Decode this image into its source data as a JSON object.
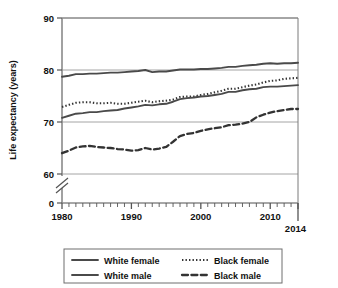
{
  "chart_data": {
    "type": "line",
    "title": "",
    "xlabel": "",
    "ylabel": "Life expectancy (years)",
    "xlim": [
      1980,
      2014
    ],
    "ylim": [
      60,
      90
    ],
    "y_axis_break": true,
    "y_axis_break_note": "axis broken between 0 and 60",
    "grid": true,
    "grid_axis": "y",
    "legend_position": "bottom",
    "y_ticks": [
      0,
      60,
      70,
      80,
      90
    ],
    "y_tick_labels": [
      "0",
      "60",
      "70",
      "80",
      "90"
    ],
    "x_ticks": [
      1980,
      1990,
      2000,
      2010,
      2014
    ],
    "x_tick_labels": [
      "1980",
      "1990",
      "2000",
      "2010",
      "2014"
    ],
    "x_minor_tick_interval": 1,
    "x": [
      1980,
      1981,
      1982,
      1983,
      1984,
      1985,
      1986,
      1987,
      1988,
      1989,
      1990,
      1991,
      1992,
      1993,
      1994,
      1995,
      1996,
      1997,
      1998,
      1999,
      2000,
      2001,
      2002,
      2003,
      2004,
      2005,
      2006,
      2007,
      2008,
      2009,
      2010,
      2011,
      2012,
      2013,
      2014
    ],
    "series": [
      {
        "name": "White female",
        "style": "solid",
        "color": "#4a4a4a",
        "values": [
          78.7,
          78.9,
          79.2,
          79.2,
          79.3,
          79.3,
          79.4,
          79.5,
          79.5,
          79.6,
          79.7,
          79.8,
          80.0,
          79.6,
          79.7,
          79.7,
          79.9,
          80.1,
          80.1,
          80.1,
          80.2,
          80.2,
          80.3,
          80.4,
          80.6,
          80.6,
          80.8,
          80.9,
          81.0,
          81.2,
          81.3,
          81.2,
          81.3,
          81.3,
          81.4
        ]
      },
      {
        "name": "Black female",
        "style": "dotted",
        "color": "#333333",
        "values": [
          72.9,
          73.3,
          73.7,
          73.8,
          73.8,
          73.6,
          73.6,
          73.7,
          73.5,
          73.5,
          73.7,
          73.9,
          74.1,
          73.8,
          74.0,
          74.1,
          74.3,
          74.8,
          74.9,
          74.9,
          75.2,
          75.4,
          75.7,
          76.0,
          76.4,
          76.4,
          76.7,
          77.0,
          77.2,
          77.6,
          77.9,
          78.0,
          78.3,
          78.4,
          78.5
        ]
      },
      {
        "name": "White male",
        "style": "solid",
        "color": "#4a4a4a",
        "values": [
          70.8,
          71.2,
          71.6,
          71.7,
          71.9,
          71.9,
          72.1,
          72.2,
          72.3,
          72.6,
          72.8,
          73.0,
          73.3,
          73.2,
          73.4,
          73.5,
          73.9,
          74.4,
          74.6,
          74.7,
          74.9,
          75.0,
          75.2,
          75.4,
          75.8,
          75.8,
          76.1,
          76.3,
          76.4,
          76.7,
          76.8,
          76.8,
          76.9,
          77.0,
          77.1
        ]
      },
      {
        "name": "Black male",
        "style": "dashed",
        "color": "#333333",
        "values": [
          64.0,
          64.5,
          65.1,
          65.3,
          65.4,
          65.2,
          65.1,
          65.0,
          64.8,
          64.7,
          64.5,
          64.6,
          65.0,
          64.7,
          64.9,
          65.2,
          66.2,
          67.3,
          67.7,
          67.9,
          68.3,
          68.6,
          68.8,
          69.0,
          69.4,
          69.5,
          69.7,
          70.0,
          70.9,
          71.4,
          71.8,
          72.1,
          72.3,
          72.5,
          72.5
        ]
      }
    ]
  },
  "legend": {
    "entries": [
      {
        "label": "White female",
        "style": "solid"
      },
      {
        "label": "Black female",
        "style": "dotted"
      },
      {
        "label": "White male",
        "style": "solid"
      },
      {
        "label": "Black male",
        "style": "dashed"
      }
    ]
  }
}
